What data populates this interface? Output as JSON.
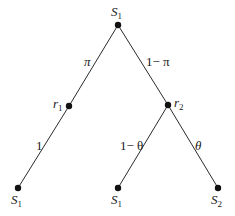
{
  "diagram": {
    "type": "probability-tree",
    "nodes": [
      {
        "id": "root",
        "label_base": "S",
        "label_sub": "1",
        "x": 118,
        "y": 25
      },
      {
        "id": "r1",
        "label_base": "r",
        "label_sub": "1",
        "x": 69,
        "y": 106
      },
      {
        "id": "r2",
        "label_base": "r",
        "label_sub": "2",
        "x": 168,
        "y": 105
      },
      {
        "id": "leaf-left",
        "label_base": "S",
        "label_sub": "1",
        "x": 18,
        "y": 188
      },
      {
        "id": "leaf-mid",
        "label_base": "S",
        "label_sub": "1",
        "x": 118,
        "y": 188
      },
      {
        "id": "leaf-right",
        "label_base": "S",
        "label_sub": "2",
        "x": 218,
        "y": 188
      }
    ],
    "edges": [
      {
        "from": "root",
        "to": "r1",
        "label": "π"
      },
      {
        "from": "root",
        "to": "r2",
        "label": "1− π"
      },
      {
        "from": "r1",
        "to": "leaf-left",
        "label": "1"
      },
      {
        "from": "r2",
        "to": "leaf-mid",
        "label": "1− θ"
      },
      {
        "from": "r2",
        "to": "leaf-right",
        "label": "θ"
      }
    ],
    "colors": {
      "line": "#2a2a2a",
      "node": "#111111",
      "background": "#ffffff"
    }
  }
}
